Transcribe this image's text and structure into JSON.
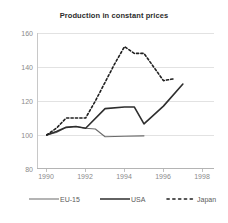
{
  "chart_data": {
    "type": "line",
    "title": "Production in constant prices",
    "xlabel": "",
    "ylabel": "",
    "xlim": [
      1989.5,
      1998.6
    ],
    "ylim": [
      80,
      160
    ],
    "grid": true,
    "grid_axis": "y",
    "legend_position": "bottom",
    "xticks": [
      "1990",
      "1992",
      "1994",
      "1996",
      "1998"
    ],
    "xtick_values": [
      1990,
      1992,
      1994,
      1996,
      1998
    ],
    "yticks": [
      "80",
      "100",
      "120",
      "140",
      "160"
    ],
    "ytick_values": [
      80,
      100,
      120,
      140,
      160
    ],
    "series": [
      {
        "name": "EU-15",
        "style": "solid",
        "color": "#6b6b6b",
        "width": 1.1,
        "x": [
          1990,
          1990.5,
          1991,
          1991.5,
          1992,
          1992.5,
          1993,
          1994,
          1995
        ],
        "values": [
          100,
          101.5,
          104.5,
          105,
          104,
          103.5,
          99,
          99.3,
          99.5
        ]
      },
      {
        "name": "USA",
        "style": "solid",
        "color": "#2e2e2e",
        "width": 1.6,
        "x": [
          1990,
          1990.5,
          1991,
          1991.5,
          1992,
          1993,
          1994,
          1994.5,
          1995,
          1996,
          1997
        ],
        "values": [
          100,
          102,
          104.5,
          105,
          104,
          115.5,
          116.5,
          116.5,
          106.5,
          117,
          130
        ]
      },
      {
        "name": "Japan",
        "style": "dotted",
        "color": "#1f1f1f",
        "width": 1.6,
        "x": [
          1990,
          1990.5,
          1991,
          1991.5,
          1992,
          1992.5,
          1993,
          1993.5,
          1994,
          1994.5,
          1995,
          1995.5,
          1996,
          1996.5
        ],
        "values": [
          100,
          104,
          110,
          110,
          110,
          120,
          131,
          142,
          152,
          148,
          148,
          140,
          132,
          133
        ]
      }
    ]
  },
  "legend": {
    "items": [
      {
        "label": "EU-15"
      },
      {
        "label": "USA"
      },
      {
        "label": "Japan"
      }
    ]
  }
}
